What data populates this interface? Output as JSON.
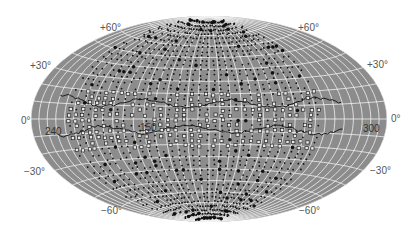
{
  "map": {
    "projection": "all-sky elliptical (Aitoff/Hammer) projection",
    "colors": {
      "background": "#ffffff",
      "sky_fill": "#8c8c8c",
      "graticule": "#f2f2f2",
      "markers": "#111111",
      "open_markers": "#e8e8e8",
      "contour": "#1a1a1a",
      "label_text": "#555555"
    },
    "latitude_labels": {
      "left": [
        "+60°",
        "+30°",
        "0°",
        "−30°",
        "−60°"
      ],
      "right": [
        "+60°",
        "+30°",
        "0°",
        "−30°",
        "−60°"
      ]
    },
    "longitude_labels": [
      "240",
      "150",
      "300"
    ]
  }
}
